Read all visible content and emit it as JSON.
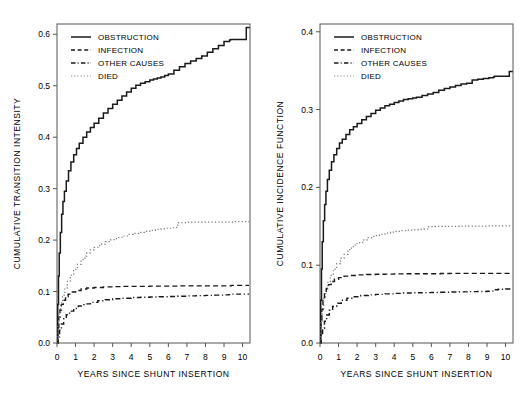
{
  "figure": {
    "panels": [
      {
        "id": "left",
        "ylabel": "CUMULATIVE TRANSITION INTENSITY",
        "xlabel": "YEARS SINCE SHUNT INSERTION",
        "yticks": [
          "0.0",
          "0.1",
          "0.2",
          "0.3",
          "0.4",
          "0.5",
          "0.6"
        ],
        "xticks": [
          "0",
          "1",
          "2",
          "3",
          "4",
          "5",
          "6",
          "7",
          "8",
          "9",
          "10"
        ],
        "legend": [
          "OBSTRUCTION",
          "INFECTION",
          "OTHER CAUSES",
          "DIED"
        ]
      },
      {
        "id": "right",
        "ylabel": "CUMULATIVE INCIDENCE FUNCTION",
        "xlabel": "YEARS SINCE SHUNT INSERTION",
        "yticks": [
          "0.0",
          "0.1",
          "0.2",
          "0.3",
          "0.4"
        ],
        "xticks": [
          "0",
          "1",
          "2",
          "3",
          "4",
          "5",
          "6",
          "7",
          "8",
          "9",
          "10"
        ],
        "legend": [
          "OBSTRUCTION",
          "INFECTION",
          "OTHER CAUSES",
          "DIED"
        ]
      }
    ]
  },
  "chart_data": [
    {
      "type": "line",
      "title": "",
      "panel": "left",
      "xlabel": "YEARS SINCE SHUNT INSERTION",
      "ylabel": "CUMULATIVE TRANSITION INTENSITY",
      "xlim": [
        0,
        10.4
      ],
      "ylim": [
        0.0,
        0.62
      ],
      "xticks": [
        0,
        1,
        2,
        3,
        4,
        5,
        6,
        7,
        8,
        9,
        10
      ],
      "yticks": [
        0.0,
        0.1,
        0.2,
        0.3,
        0.4,
        0.5,
        0.6
      ],
      "grid": false,
      "legend_position": "top-left",
      "step": true,
      "series": [
        {
          "name": "OBSTRUCTION",
          "style": "solid",
          "x": [
            0,
            0.04,
            0.08,
            0.12,
            0.18,
            0.25,
            0.32,
            0.4,
            0.5,
            0.62,
            0.75,
            0.9,
            1.05,
            1.2,
            1.4,
            1.6,
            1.8,
            2.0,
            2.25,
            2.5,
            2.75,
            3.0,
            3.25,
            3.5,
            3.75,
            4.0,
            4.25,
            4.5,
            4.75,
            5.0,
            5.2,
            5.4,
            5.6,
            5.8,
            6.0,
            6.3,
            6.6,
            6.9,
            7.2,
            7.5,
            7.8,
            8.1,
            8.4,
            8.7,
            9.0,
            9.3,
            9.35,
            10.0,
            10.2,
            10.35
          ],
          "y": [
            0.0,
            0.075,
            0.13,
            0.175,
            0.215,
            0.25,
            0.275,
            0.295,
            0.315,
            0.335,
            0.352,
            0.366,
            0.378,
            0.388,
            0.4,
            0.41,
            0.419,
            0.427,
            0.437,
            0.447,
            0.456,
            0.464,
            0.472,
            0.48,
            0.488,
            0.495,
            0.501,
            0.505,
            0.508,
            0.511,
            0.513,
            0.515,
            0.517,
            0.52,
            0.523,
            0.53,
            0.537,
            0.543,
            0.548,
            0.553,
            0.558,
            0.565,
            0.572,
            0.578,
            0.586,
            0.589,
            0.59,
            0.59,
            0.613,
            0.614
          ]
        },
        {
          "name": "INFECTION",
          "style": "dashed",
          "x": [
            0,
            0.05,
            0.1,
            0.16,
            0.24,
            0.34,
            0.46,
            0.6,
            0.78,
            1.0,
            1.3,
            1.6,
            2.0,
            2.5,
            3.0,
            3.5,
            4.0,
            4.5,
            5.0,
            5.5,
            6.0,
            6.5,
            7.0,
            7.5,
            8.0,
            8.5,
            9.0,
            9.3,
            9.4,
            10.35
          ],
          "y": [
            0.0,
            0.03,
            0.05,
            0.064,
            0.075,
            0.083,
            0.09,
            0.095,
            0.099,
            0.102,
            0.105,
            0.107,
            0.108,
            0.109,
            0.1095,
            0.11,
            0.11,
            0.11,
            0.1105,
            0.1105,
            0.1105,
            0.111,
            0.111,
            0.111,
            0.111,
            0.111,
            0.111,
            0.111,
            0.112,
            0.112
          ]
        },
        {
          "name": "OTHER CAUSES",
          "style": "dashdot",
          "x": [
            0,
            0.06,
            0.14,
            0.24,
            0.36,
            0.5,
            0.68,
            0.9,
            1.15,
            1.45,
            1.8,
            2.2,
            2.6,
            3.0,
            3.5,
            4.0,
            4.5,
            5.0,
            5.5,
            6.0,
            6.5,
            7.0,
            7.5,
            8.0,
            8.5,
            9.0,
            9.25,
            9.35,
            10.35
          ],
          "y": [
            0.0,
            0.012,
            0.025,
            0.037,
            0.047,
            0.055,
            0.062,
            0.067,
            0.072,
            0.076,
            0.079,
            0.082,
            0.084,
            0.086,
            0.087,
            0.0885,
            0.089,
            0.0895,
            0.09,
            0.0905,
            0.091,
            0.0915,
            0.092,
            0.0925,
            0.093,
            0.0935,
            0.094,
            0.095,
            0.095
          ]
        },
        {
          "name": "DIED",
          "style": "dotted",
          "x": [
            0,
            0.05,
            0.12,
            0.2,
            0.3,
            0.42,
            0.56,
            0.72,
            0.9,
            1.1,
            1.3,
            1.5,
            1.6,
            1.8,
            2.0,
            2.3,
            2.6,
            2.9,
            3.2,
            3.5,
            3.8,
            4.1,
            4.4,
            4.7,
            5.0,
            5.3,
            5.6,
            5.9,
            6.2,
            6.45,
            6.5,
            7.0,
            7.5,
            8.0,
            8.5,
            9.0,
            9.5,
            10.0,
            10.35
          ],
          "y": [
            0.0,
            0.035,
            0.06,
            0.078,
            0.093,
            0.107,
            0.12,
            0.132,
            0.143,
            0.153,
            0.162,
            0.169,
            0.175,
            0.181,
            0.186,
            0.192,
            0.197,
            0.201,
            0.205,
            0.208,
            0.211,
            0.213,
            0.215,
            0.217,
            0.219,
            0.221,
            0.222,
            0.223,
            0.224,
            0.225,
            0.234,
            0.235,
            0.235,
            0.235,
            0.235,
            0.235,
            0.236,
            0.236,
            0.236
          ]
        }
      ]
    },
    {
      "type": "line",
      "title": "",
      "panel": "right",
      "xlabel": "YEARS SINCE SHUNT INSERTION",
      "ylabel": "CUMULATIVE INCIDENCE FUNCTION",
      "xlim": [
        0,
        10.4
      ],
      "ylim": [
        0.0,
        0.41
      ],
      "xticks": [
        0,
        1,
        2,
        3,
        4,
        5,
        6,
        7,
        8,
        9,
        10
      ],
      "yticks": [
        0.0,
        0.1,
        0.2,
        0.3,
        0.4
      ],
      "grid": false,
      "legend_position": "top-left",
      "step": true,
      "series": [
        {
          "name": "OBSTRUCTION",
          "style": "solid",
          "x": [
            0,
            0.04,
            0.08,
            0.12,
            0.18,
            0.25,
            0.32,
            0.4,
            0.5,
            0.62,
            0.75,
            0.9,
            1.05,
            1.2,
            1.4,
            1.6,
            1.8,
            2.0,
            2.25,
            2.5,
            2.75,
            3.0,
            3.25,
            3.5,
            3.75,
            4.0,
            4.25,
            4.5,
            4.75,
            5.0,
            5.2,
            5.5,
            5.8,
            6.1,
            6.4,
            6.7,
            7.0,
            7.3,
            7.6,
            7.9,
            8.2,
            8.5,
            8.8,
            9.1,
            9.35,
            9.4,
            10.0,
            10.2,
            10.35
          ],
          "y": [
            0.0,
            0.055,
            0.095,
            0.13,
            0.157,
            0.178,
            0.195,
            0.21,
            0.222,
            0.233,
            0.242,
            0.25,
            0.257,
            0.262,
            0.268,
            0.274,
            0.278,
            0.282,
            0.287,
            0.291,
            0.295,
            0.299,
            0.302,
            0.305,
            0.307,
            0.309,
            0.311,
            0.313,
            0.314,
            0.315,
            0.316,
            0.318,
            0.32,
            0.322,
            0.325,
            0.327,
            0.329,
            0.331,
            0.333,
            0.334,
            0.338,
            0.339,
            0.34,
            0.341,
            0.342,
            0.343,
            0.343,
            0.349,
            0.35
          ]
        },
        {
          "name": "INFECTION",
          "style": "dashed",
          "x": [
            0,
            0.05,
            0.1,
            0.16,
            0.24,
            0.34,
            0.46,
            0.6,
            0.78,
            1.0,
            1.3,
            1.6,
            2.0,
            2.5,
            3.0,
            3.5,
            4.0,
            4.5,
            5.0,
            5.5,
            6.0,
            6.5,
            7.0,
            7.5,
            8.0,
            8.5,
            9.0,
            9.5,
            10.0,
            10.35
          ],
          "y": [
            0.0,
            0.026,
            0.043,
            0.055,
            0.064,
            0.07,
            0.075,
            0.079,
            0.082,
            0.084,
            0.086,
            0.0868,
            0.0875,
            0.088,
            0.0883,
            0.0885,
            0.0888,
            0.089,
            0.089,
            0.089,
            0.089,
            0.0893,
            0.0895,
            0.0895,
            0.0895,
            0.0895,
            0.0895,
            0.0895,
            0.0895,
            0.0895
          ]
        },
        {
          "name": "OTHER CAUSES",
          "style": "dashdot",
          "x": [
            0,
            0.06,
            0.14,
            0.24,
            0.36,
            0.5,
            0.68,
            0.9,
            1.15,
            1.45,
            1.8,
            2.2,
            2.6,
            3.0,
            3.5,
            4.0,
            4.5,
            5.0,
            5.5,
            6.0,
            6.5,
            7.0,
            7.5,
            8.0,
            8.5,
            9.0,
            9.25,
            9.35,
            9.6,
            10.0,
            10.35
          ],
          "y": [
            0.0,
            0.009,
            0.019,
            0.028,
            0.036,
            0.042,
            0.047,
            0.051,
            0.055,
            0.0575,
            0.0595,
            0.061,
            0.0618,
            0.0625,
            0.0632,
            0.0638,
            0.0642,
            0.0645,
            0.0648,
            0.065,
            0.0652,
            0.0655,
            0.0657,
            0.066,
            0.0662,
            0.0665,
            0.0667,
            0.0685,
            0.069,
            0.0695,
            0.07
          ]
        },
        {
          "name": "DIED",
          "style": "dotted",
          "x": [
            0,
            0.05,
            0.12,
            0.2,
            0.3,
            0.42,
            0.56,
            0.72,
            0.9,
            1.1,
            1.3,
            1.5,
            1.6,
            1.8,
            2.0,
            2.3,
            2.6,
            2.9,
            3.2,
            3.5,
            3.8,
            4.1,
            4.4,
            4.7,
            5.0,
            5.3,
            5.6,
            5.75,
            5.8,
            6.2,
            6.6,
            7.0,
            7.5,
            8.0,
            8.5,
            9.0,
            9.5,
            10.0,
            10.35
          ],
          "y": [
            0.0,
            0.026,
            0.044,
            0.057,
            0.068,
            0.078,
            0.087,
            0.095,
            0.102,
            0.109,
            0.114,
            0.118,
            0.122,
            0.126,
            0.129,
            0.1325,
            0.1355,
            0.138,
            0.1398,
            0.1412,
            0.1425,
            0.1435,
            0.1443,
            0.145,
            0.1455,
            0.146,
            0.1463,
            0.1465,
            0.1495,
            0.1498,
            0.15,
            0.15,
            0.1502,
            0.1503,
            0.1503,
            0.1505,
            0.1505,
            0.1505,
            0.1505
          ]
        }
      ]
    }
  ]
}
